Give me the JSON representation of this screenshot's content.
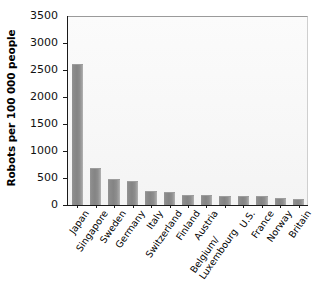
{
  "chart_data": {
    "type": "bar",
    "title": "",
    "xlabel": "",
    "ylabel": "Robots per 100 000 people",
    "ylim": [
      0,
      3500
    ],
    "yticks": [
      "0",
      "500",
      "1000",
      "1500",
      "2000",
      "2500",
      "3000",
      "3500"
    ],
    "ytick_values": [
      0,
      500,
      1000,
      1500,
      2000,
      2500,
      3000,
      3500
    ],
    "grid": false,
    "legend": null,
    "bar_color": "#8a8a8a",
    "plot_background": "#f7f7f7",
    "categories": [
      "Japan",
      "Singapore",
      "Sweden",
      "Germany",
      "Italy",
      "Switzerland",
      "Finland",
      "Austria",
      "Belgium/ Luxembourg",
      "U.S.",
      "France",
      "Norway",
      "Britain"
    ],
    "values": [
      2620,
      690,
      480,
      440,
      255,
      245,
      190,
      180,
      175,
      170,
      165,
      125,
      120
    ]
  }
}
